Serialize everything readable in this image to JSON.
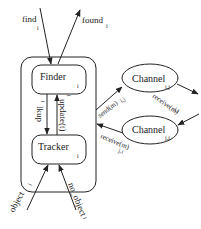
{
  "diagram": {
    "type": "process-interaction",
    "container": {
      "label": ""
    },
    "nodes": {
      "finder": {
        "label": "Finder",
        "sub": "i"
      },
      "tracker": {
        "label": "Tracker",
        "sub": "i"
      },
      "channel_ij": {
        "label": "Channel",
        "sub": "i,j"
      },
      "channel_ji": {
        "label": "Channel",
        "sub": "j,i"
      }
    },
    "edges": {
      "find": {
        "label": "find",
        "sub": "i",
        "from": "environment",
        "to": "finder"
      },
      "found": {
        "label": "found",
        "sub": "i",
        "from": "finder",
        "to": "environment"
      },
      "lkup": {
        "label": "lkup",
        "sub": "i",
        "from": "finder",
        "to": "tracker"
      },
      "update": {
        "label": "update(t)",
        "sub": "i",
        "from": "tracker",
        "to": "finder"
      },
      "send": {
        "label": "send(m)",
        "sub": "i,j",
        "from": "container",
        "to": "channel_ij"
      },
      "receive_ij": {
        "label": "receive(m)",
        "sub": "i,j",
        "from": "channel_ij",
        "to": "environment"
      },
      "incoming_ji": {
        "label": "",
        "from": "environment",
        "to": "channel_ji"
      },
      "receive_ji": {
        "label": "receive(m)",
        "sub": "j,i",
        "from": "channel_ji",
        "to": "container"
      },
      "object": {
        "label": "object",
        "sub": "i",
        "from": "environment",
        "to": "tracker"
      },
      "no_object": {
        "label": "no_object",
        "sub": "i",
        "from": "environment",
        "to": "tracker"
      }
    },
    "colors": {
      "stroke": "#222222",
      "background": "#ffffff"
    }
  }
}
